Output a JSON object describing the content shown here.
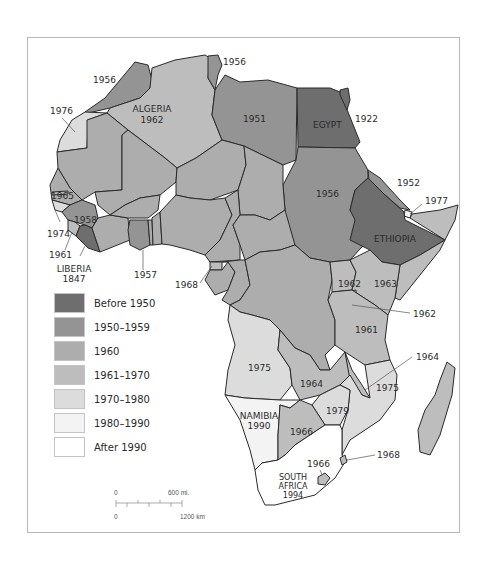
{
  "colors": {
    "before_1950": "#6e6e6e",
    "c1950_1959": "#949494",
    "c1960": "#adadad",
    "c1961_1970": "#bdbdbd",
    "c1970_1980": "#dcdcdc",
    "c1980_1990": "#f3f3f3",
    "after_1990": "#ffffff",
    "border": "#2a2a2a"
  },
  "legend": {
    "items": [
      {
        "label": "Before 1950",
        "color": "#6e6e6e"
      },
      {
        "label": "1950–1959",
        "color": "#949494"
      },
      {
        "label": "1960",
        "color": "#adadad"
      },
      {
        "label": "1961–1970",
        "color": "#bdbdbd"
      },
      {
        "label": "1970–1980",
        "color": "#dcdcdc"
      },
      {
        "label": "1980–1990",
        "color": "#f3f3f3"
      },
      {
        "label": "After 1990",
        "color": "#ffffff"
      }
    ]
  },
  "labels": {
    "morocco": "1956",
    "tunisia": "1956",
    "algeria_name": "ALGERIA",
    "algeria_year": "1962",
    "libya": "1951",
    "egypt_name": "EGYPT",
    "egypt_year": "1922",
    "western_sahara": "1976",
    "sudan": "1956",
    "eritrea": "1952",
    "djibouti": "1977",
    "ethiopia_name": "ETHIOPIA",
    "gambia": "1965",
    "guinea": "1958",
    "guinea_bissau": "1974",
    "sierra_leone": "1961",
    "liberia_name": "LIBERIA",
    "liberia_year": "1847",
    "ghana": "1957",
    "eq_guinea": "1968",
    "uganda": "1962",
    "kenya": "1963",
    "rwanda_burundi": "1962",
    "tanzania": "1961",
    "malawi": "1964",
    "angola": "1975",
    "zambia": "1964",
    "mozambique": "1975",
    "zimbabwe": "1979",
    "namibia_name": "NAMIBIA",
    "namibia_year": "1990",
    "botswana": "1966",
    "lesotho": "1966",
    "swaziland": "1968",
    "south_africa_name1": "SOUTH",
    "south_africa_name2": "AFRICA",
    "south_africa_year": "1994"
  },
  "scale": {
    "mi_zero": "0",
    "mi_label": "600 mi.",
    "km_zero": "0",
    "km_label": "1200 km"
  }
}
